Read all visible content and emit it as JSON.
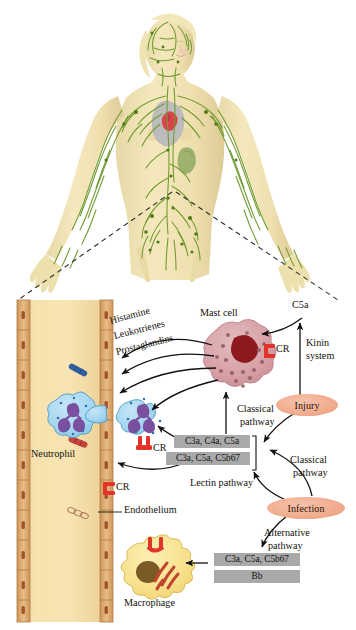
{
  "figure": {
    "top_panel": {
      "name": "human-lymphatic-system-illustration",
      "description": "Female human figure with lymphatic vessels and nodes highlighted in green, heart and spleen visible"
    }
  },
  "colors": {
    "vessel_wall": "#d8a269",
    "vessel_lumen": "#f3dca4",
    "mast_cell": "#d9a4a8",
    "mast_nucleus": "#8e1a20",
    "neutrophil": "#9fd3ef",
    "neutrophil_nucleus": "#7b4fa0",
    "macrophage": "#f7e08a",
    "macrophage_nucleus": "#7a5a25",
    "receptor_red": "#e0342a",
    "grey_box": "#a9a9a9",
    "salmon": "#f0ab8c",
    "lymph_green": "#6f9a2e",
    "skin": "#f1e3b4"
  },
  "mediators": {
    "histamine": "Histamine",
    "leukotrienes": "Leukotrienes",
    "prostaglandins": "Prostaglandins"
  },
  "cells": {
    "mast_cell": "Mast cell",
    "neutrophil": "Neutrophil",
    "macrophage": "Macrophage",
    "endothelium": "Endothelium"
  },
  "receptors": {
    "mast_cr": "CR",
    "neutrophil_cr": "CR",
    "endothelium_cr": "CR"
  },
  "anaphylatoxins": {
    "c5a": "C5a"
  },
  "pathways": {
    "kinin_system": "Kinin\nsystem",
    "kinin_line1": "Kinin",
    "kinin_line2": "system",
    "classical_upper_line1": "Classical",
    "classical_upper_line2": "pathway",
    "classical_lower_line1": "Classical",
    "classical_lower_line2": "pathway",
    "lectin": "Lectin pathway",
    "alternative_line1": "Alternative",
    "alternative_line2": "pathway"
  },
  "stimuli": {
    "injury": "Injury",
    "infection": "Infection"
  },
  "complement_boxes": {
    "upper_1": "C3a, C4a, C5a",
    "upper_2": "C3a, C5a, C5b67",
    "lower_1": "C3a, C5a, C5b67",
    "lower_2": "Bb"
  }
}
